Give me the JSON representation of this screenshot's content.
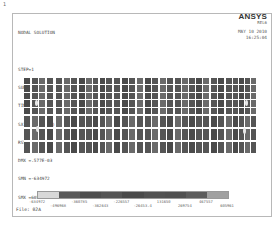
{
  "window": {
    "number": "1"
  },
  "info": {
    "lines": [
      "NODAL SOLUTION",
      "",
      "STEP=1",
      "SUB =1",
      "TIME=1",
      "SX       (AVG)",
      "RSYS=0",
      "DMX =.577E-03",
      "SMN =-634972",
      "SMX =605961"
    ]
  },
  "brand": {
    "logo": "ANSYS",
    "version": "REL6",
    "date": "MAY 10 2010",
    "time": "16:25:04"
  },
  "model": {
    "colors": {
      "dark": "#4a4a4a",
      "mid": "#555555",
      "light": "#6a6a6a",
      "gap": "#ffffff"
    },
    "blocks": [
      {
        "x": 0,
        "w": 29
      },
      {
        "x": 32,
        "w": 29
      },
      {
        "x": 62,
        "w": 26
      },
      {
        "x": 90,
        "w": 29
      },
      {
        "x": 121,
        "w": 28
      },
      {
        "x": 151,
        "w": 27
      },
      {
        "x": 179,
        "w": 29
      },
      {
        "x": 209,
        "w": 23
      }
    ],
    "hotspots": [
      {
        "x": 11,
        "y": 22
      },
      {
        "x": 12,
        "y": 48
      },
      {
        "x": 221,
        "y": 22
      },
      {
        "x": 219,
        "y": 50
      }
    ]
  },
  "legend": {
    "colors": [
      "#d8d8d8",
      "#5a5a5a",
      "#4e4e4e",
      "#555555",
      "#4a4a4a",
      "#525252",
      "#505050",
      "#5c5c5c",
      "#a0a0a0"
    ],
    "labels_top": [
      {
        "text": "-634972",
        "pos": 0
      },
      {
        "text": "-360785",
        "pos": 0.222
      },
      {
        "text": "-226557",
        "pos": 0.444
      },
      {
        "text": "131650",
        "pos": 0.667
      },
      {
        "text": "467557",
        "pos": 0.889
      }
    ],
    "labels_bottom": [
      {
        "text": "-496968",
        "pos": 0.111
      },
      {
        "text": "-362643",
        "pos": 0.333
      },
      {
        "text": "-26453.4",
        "pos": 0.556
      },
      {
        "text": "269754",
        "pos": 0.778
      },
      {
        "text": "605961",
        "pos": 1.0
      }
    ]
  },
  "file": {
    "label": "File: 02A"
  }
}
